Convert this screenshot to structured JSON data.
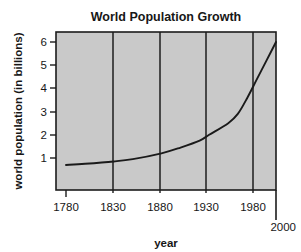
{
  "chart_data": {
    "type": "line",
    "title": "World Population Growth",
    "xlabel": "year",
    "ylabel": "world population (in billions)",
    "xlim": [
      1780,
      2000
    ],
    "ylim": [
      0,
      6.5
    ],
    "grid": "vertical-only",
    "legend": "none",
    "plot_background": "#c9c9c9",
    "line_color": "#1a1a1a",
    "x_ticks": [
      "1780",
      "1830",
      "1880",
      "1930",
      "1980",
      "2000"
    ],
    "x_tick_values": [
      1780,
      1830,
      1880,
      1930,
      1980,
      2000
    ],
    "y_ticks": [
      "1",
      "2",
      "3",
      "4",
      "5",
      "6"
    ],
    "y_tick_values": [
      1,
      2,
      3,
      4,
      5,
      6
    ],
    "x": [
      1780,
      1800,
      1830,
      1850,
      1880,
      1900,
      1920,
      1930,
      1950,
      1960,
      1970,
      1980,
      1990,
      2000
    ],
    "values": [
      0.7,
      0.75,
      0.85,
      0.95,
      1.2,
      1.45,
      1.75,
      2.0,
      2.5,
      2.9,
      3.6,
      4.4,
      5.2,
      6.0
    ],
    "series": [
      {
        "name": "world population",
        "values": [
          0.7,
          0.75,
          0.85,
          0.95,
          1.2,
          1.45,
          1.75,
          2.0,
          2.5,
          2.9,
          3.6,
          4.4,
          5.2,
          6.0
        ]
      }
    ]
  },
  "labels": {
    "title": "World Population Growth",
    "y_axis_title": "world population (in billions)",
    "x_axis_title": "year",
    "y1": "1",
    "y2": "2",
    "y3": "3",
    "y4": "4",
    "y5": "5",
    "y6": "6",
    "x1780": "1780",
    "x1830": "1830",
    "x1880": "1880",
    "x1930": "1930",
    "x1980": "1980",
    "x2000": "2000"
  }
}
